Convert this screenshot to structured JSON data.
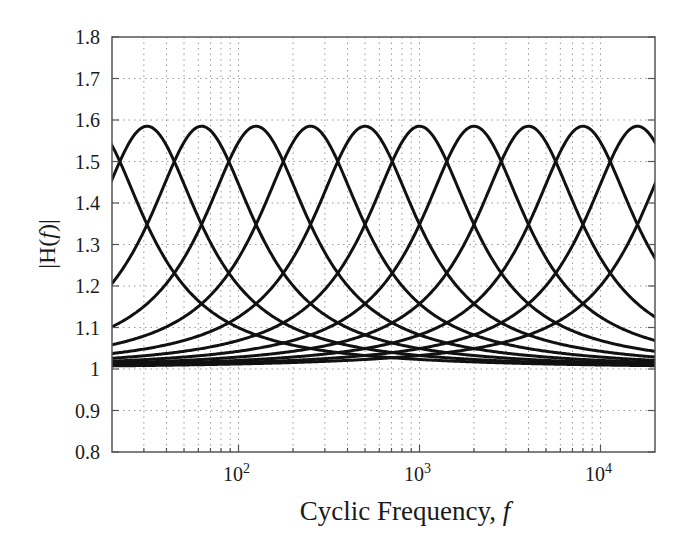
{
  "chart_data": {
    "type": "line",
    "title": "",
    "xlabel": "Cyclic Frequency, f",
    "xlabel_parts": {
      "text": "Cyclic Frequency, ",
      "var": "f"
    },
    "ylabel": "|H(f)|",
    "ylabel_parts": {
      "pre": "|H(",
      "var": "f",
      "post": ")|"
    },
    "xscale": "log",
    "xlim": [
      20,
      20000
    ],
    "ylim": [
      0.8,
      1.8
    ],
    "grid": true,
    "legend": null,
    "yticks": [
      0.8,
      0.9,
      1.0,
      1.1,
      1.2,
      1.3,
      1.4,
      1.5,
      1.6,
      1.7,
      1.8
    ],
    "ytick_labels": [
      "0.8",
      "0.9",
      "1",
      "1.1",
      "1.2",
      "1.3",
      "1.4",
      "1.5",
      "1.6",
      "1.7",
      "1.8"
    ],
    "xticks": [
      100,
      1000,
      10000
    ],
    "xtick_labels": [
      {
        "base": "10",
        "exp": "2"
      },
      {
        "base": "10",
        "exp": "3"
      },
      {
        "base": "10",
        "exp": "4"
      }
    ],
    "series_description": "Octave-spaced peaking filter magnitude responses, each peaking at about 1.585 (+4 dB) and tending to 1 far from center; adjacent curves cross near 1.5",
    "peak_gain": 1.585,
    "center_frequencies_hz": [
      15.625,
      31.25,
      62.5,
      125,
      250,
      500,
      1000,
      2000,
      4000,
      8000,
      16000,
      32000
    ],
    "series": [
      {
        "name": "fc=15.6 Hz",
        "fc": 15.625,
        "peak": 1.585
      },
      {
        "name": "fc=31.25 Hz",
        "fc": 31.25,
        "peak": 1.585
      },
      {
        "name": "fc=62.5 Hz",
        "fc": 62.5,
        "peak": 1.585
      },
      {
        "name": "fc=125 Hz",
        "fc": 125,
        "peak": 1.585
      },
      {
        "name": "fc=250 Hz",
        "fc": 250,
        "peak": 1.585
      },
      {
        "name": "fc=500 Hz",
        "fc": 500,
        "peak": 1.585
      },
      {
        "name": "fc=1 kHz",
        "fc": 1000,
        "peak": 1.585
      },
      {
        "name": "fc=2 kHz",
        "fc": 2000,
        "peak": 1.585
      },
      {
        "name": "fc=4 kHz",
        "fc": 4000,
        "peak": 1.585
      },
      {
        "name": "fc=8 kHz",
        "fc": 8000,
        "peak": 1.585
      },
      {
        "name": "fc=16 kHz",
        "fc": 16000,
        "peak": 1.585
      },
      {
        "name": "fc=32 kHz",
        "fc": 32000,
        "peak": 1.585
      }
    ],
    "crossover_levels": [
      1.5,
      1.34,
      1.1,
      1.03
    ],
    "colors": {
      "line": "#111111",
      "grid": "#9a9a9a",
      "axis": "#555555",
      "text": "#1a1a1a"
    }
  }
}
